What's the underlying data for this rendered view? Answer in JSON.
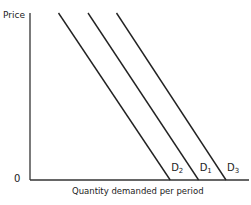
{
  "chart_data": {
    "type": "line",
    "title": "",
    "xlabel": "Quantity demanded per period",
    "ylabel": "Price",
    "origin_label": "0",
    "grid": false,
    "legend": "inline labels at line ends",
    "axis_ticks": "none (schematic)",
    "series": [
      {
        "name": "D2",
        "label_main": "D",
        "label_sub": "2",
        "x": [
          0.13,
          0.64
        ],
        "y": [
          1.0,
          0.0
        ],
        "description": "leftmost demand curve (decrease in demand)"
      },
      {
        "name": "D1",
        "label_main": "D",
        "label_sub": "1",
        "x": [
          0.265,
          0.77
        ],
        "y": [
          1.0,
          0.0
        ],
        "description": "original demand curve"
      },
      {
        "name": "D3",
        "label_main": "D",
        "label_sub": "3",
        "x": [
          0.395,
          0.895
        ],
        "y": [
          1.0,
          0.0
        ],
        "description": "rightmost demand curve (increase in demand)"
      }
    ],
    "xlim": [
      0,
      1
    ],
    "ylim": [
      0,
      1
    ]
  },
  "labels": {
    "price": "Price",
    "origin": "0",
    "quantity": "Quantity demanded per period"
  }
}
